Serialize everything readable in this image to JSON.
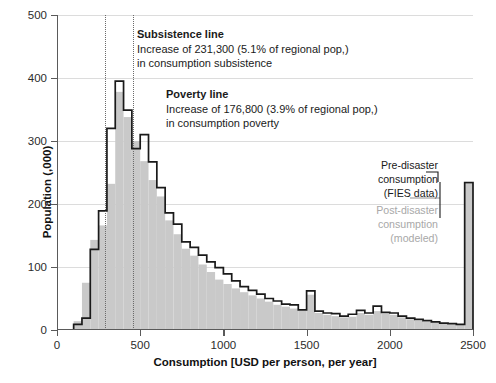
{
  "chart_data": {
    "type": "bar",
    "title": "",
    "xlabel": "Consumption [USD per person, per year]",
    "ylabel": "Population (,000)",
    "xlim": [
      0,
      2500
    ],
    "ylim": [
      0,
      500
    ],
    "xticks": [
      0,
      500,
      1000,
      1500,
      2000,
      2500
    ],
    "xticklabels": [
      "0",
      "500",
      "1000",
      "1500",
      "2000",
      "2500"
    ],
    "yticks": [
      0,
      100,
      200,
      300,
      400,
      500
    ],
    "yticklabels": [
      "0",
      "100",
      "200",
      "300",
      "400",
      "500"
    ],
    "grid": "horizontal",
    "legend_position": "right-inside",
    "bin_width": 50,
    "bin_left_edges": [
      100,
      150,
      200,
      250,
      300,
      350,
      400,
      450,
      500,
      550,
      600,
      650,
      700,
      750,
      800,
      850,
      900,
      950,
      1000,
      1050,
      1100,
      1150,
      1200,
      1250,
      1300,
      1350,
      1400,
      1450,
      1500,
      1550,
      1600,
      1650,
      1700,
      1750,
      1800,
      1850,
      1900,
      1950,
      2000,
      2050,
      2100,
      2150,
      2200,
      2250,
      2300,
      2350,
      2400,
      2450
    ],
    "series": [
      {
        "name": "Post-disaster consumption (modeled)",
        "style": "filled-gray-bars",
        "color": "#c9c9c9",
        "values": [
          14,
          75,
          143,
          166,
          232,
          378,
          338,
          300,
          268,
          238,
          212,
          174,
          152,
          129,
          118,
          104,
          92,
          80,
          73,
          66,
          60,
          55,
          50,
          45,
          40,
          37,
          34,
          31,
          56,
          27,
          24,
          22,
          20,
          21,
          27,
          24,
          30,
          26,
          24,
          20,
          17,
          15,
          13,
          12,
          10,
          9,
          8,
          232
        ]
      },
      {
        "name": "Pre-disaster consumption (FIES data)",
        "style": "black-step-outline",
        "color": "#1a1a1a",
        "values": [
          9,
          19,
          128,
          189,
          320,
          395,
          349,
          288,
          310,
          267,
          226,
          186,
          168,
          140,
          131,
          119,
          108,
          99,
          89,
          78,
          69,
          63,
          57,
          50,
          46,
          41,
          40,
          32,
          62,
          30,
          27,
          26,
          22,
          25,
          31,
          27,
          38,
          28,
          27,
          22,
          19,
          17,
          15,
          13,
          11,
          10,
          9,
          234
        ]
      }
    ],
    "reference_lines": [
      {
        "name": "subsistence-line",
        "x": 290,
        "style": "dotted",
        "color": "#6b6b6b"
      },
      {
        "name": "poverty-line",
        "x": 455,
        "style": "dotted",
        "color": "#6b6b6b"
      }
    ],
    "annotations": [
      {
        "name": "subsistence-annotation",
        "heading": "Subsistence line",
        "line1": "Increase of 231,300 (5.1% of regional pop,)",
        "line2": "in consumption subsistence"
      },
      {
        "name": "poverty-annotation",
        "heading": "Poverty line",
        "line1": "Increase of 176,800 (3.9% of regional pop,)",
        "line2": "in consumption poverty"
      }
    ],
    "legend": [
      {
        "name": "legend-pre-disaster",
        "line1": "Pre-disaster consumption",
        "line2": "(FIES data)",
        "color": "#1a1a1a"
      },
      {
        "name": "legend-post-disaster",
        "line1": "Post-disaster consumption",
        "line2": "(modeled)",
        "color": "#a8a8a8"
      }
    ]
  }
}
